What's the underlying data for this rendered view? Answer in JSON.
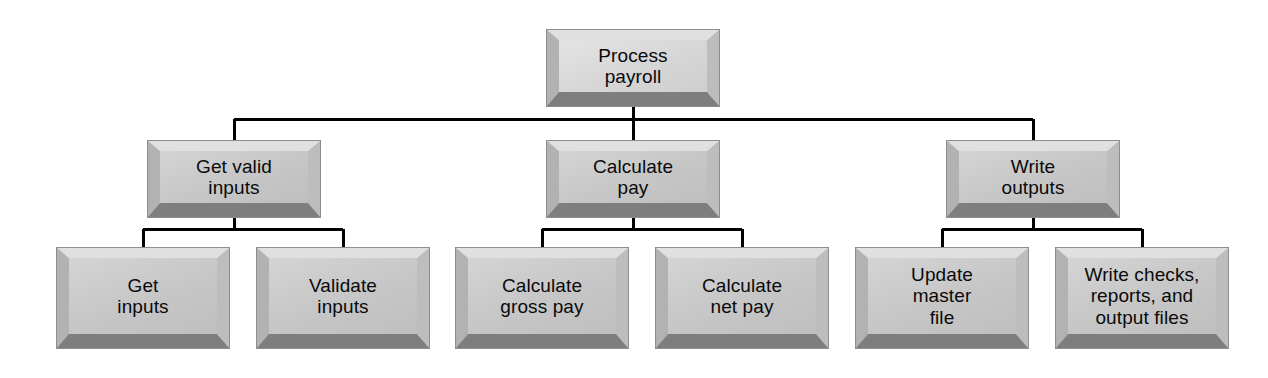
{
  "diagram": {
    "type": "structure-chart",
    "background_color": "#ffffff",
    "box_fill_color": "#c9c9c9",
    "box_highlight_color": "#e0e0e0",
    "box_shadow_color": "#7e7e7e",
    "connector_color": "#000000",
    "text_color": "#0a0a0a",
    "levels": 3,
    "nodes": [
      {
        "id": "process-payroll",
        "label": "Process\npayroll",
        "level": 1,
        "x": 547,
        "y": 30,
        "width": 172,
        "height": 76
      },
      {
        "id": "get-valid-inputs",
        "label": "Get valid\ninputs",
        "level": 2,
        "x": 148,
        "y": 141,
        "width": 172,
        "height": 76
      },
      {
        "id": "calculate-pay",
        "label": "Calculate\npay",
        "level": 2,
        "x": 547,
        "y": 141,
        "width": 172,
        "height": 76
      },
      {
        "id": "write-outputs",
        "label": "Write\noutputs",
        "level": 2,
        "x": 947,
        "y": 141,
        "width": 172,
        "height": 76
      },
      {
        "id": "get-inputs",
        "label": "Get\ninputs",
        "level": 3,
        "x": 57,
        "y": 248,
        "width": 172,
        "height": 100
      },
      {
        "id": "validate-inputs",
        "label": "Validate\ninputs",
        "level": 3,
        "x": 257,
        "y": 248,
        "width": 172,
        "height": 100
      },
      {
        "id": "calculate-gross-pay",
        "label": "Calculate\ngross pay",
        "level": 3,
        "x": 456,
        "y": 248,
        "width": 172,
        "height": 100
      },
      {
        "id": "calculate-net-pay",
        "label": "Calculate\nnet pay",
        "level": 3,
        "x": 656,
        "y": 248,
        "width": 172,
        "height": 100
      },
      {
        "id": "update-master-file",
        "label": "Update\nmaster\nfile",
        "level": 3,
        "x": 856,
        "y": 248,
        "width": 172,
        "height": 100
      },
      {
        "id": "write-checks-reports-output-files",
        "label": "Write checks,\nreports, and\noutput files",
        "level": 3,
        "x": 1056,
        "y": 248,
        "width": 172,
        "height": 100
      }
    ],
    "edges": [
      {
        "from": "process-payroll",
        "to": "get-valid-inputs"
      },
      {
        "from": "process-payroll",
        "to": "calculate-pay"
      },
      {
        "from": "process-payroll",
        "to": "write-outputs"
      },
      {
        "from": "get-valid-inputs",
        "to": "get-inputs"
      },
      {
        "from": "get-valid-inputs",
        "to": "validate-inputs"
      },
      {
        "from": "calculate-pay",
        "to": "calculate-gross-pay"
      },
      {
        "from": "calculate-pay",
        "to": "calculate-net-pay"
      },
      {
        "from": "write-outputs",
        "to": "update-master-file"
      },
      {
        "from": "write-outputs",
        "to": "write-checks-reports-output-files"
      }
    ]
  }
}
